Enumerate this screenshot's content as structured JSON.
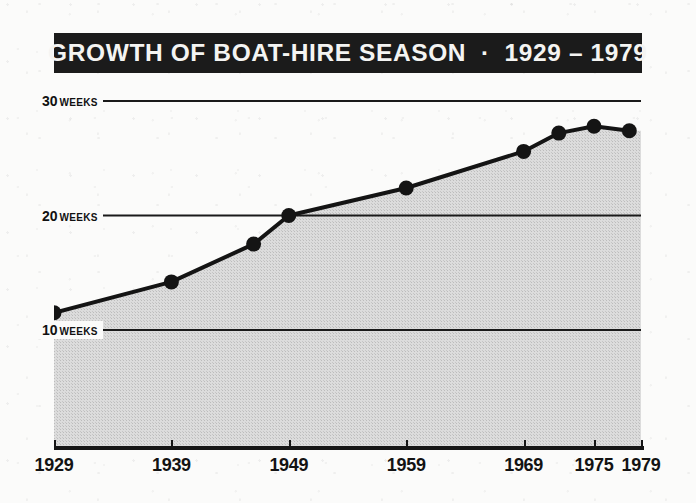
{
  "title": "GROWTH OF BOAT-HIRE SEASON  ·  1929 – 1979",
  "y_axis": {
    "unit_label": "WEEKS",
    "ticks": [
      {
        "value": "30",
        "unit": "WEEKS"
      },
      {
        "value": "20",
        "unit": "WEEKS"
      },
      {
        "value": "10",
        "unit": "WEEKS"
      }
    ]
  },
  "x_axis": {
    "labels": [
      "1929",
      "1939",
      "1949",
      "1959",
      "1969",
      "1975",
      "1979"
    ]
  },
  "colors": {
    "banner_background": "#1b1b1b",
    "banner_text": "#f4f4f2",
    "line": "#141414",
    "marker": "#141414",
    "area_fill": "#d6d6d6",
    "paper": "#fbfbfa",
    "axis": "#161616"
  },
  "chart_data": {
    "type": "line",
    "title": "GROWTH OF BOAT-HIRE SEASON  ·  1929 – 1979",
    "xlabel": "",
    "ylabel": "WEEKS",
    "xlim": [
      1929,
      1979
    ],
    "ylim": [
      0,
      32
    ],
    "grid": true,
    "gridlines_y": [
      10,
      20,
      30
    ],
    "legend": "none",
    "x_tick_labels": [
      "1929",
      "1939",
      "1949",
      "1959",
      "1969",
      "1975",
      "1979"
    ],
    "y_tick_labels": [
      "10 WEEKS",
      "20 WEEKS",
      "30 WEEKS"
    ],
    "series": [
      {
        "name": "Boat-hire season length",
        "unit": "weeks",
        "points": [
          {
            "x": 1929,
            "y": 11.5
          },
          {
            "x": 1939,
            "y": 14.2
          },
          {
            "x": 1946,
            "y": 17.5
          },
          {
            "x": 1949,
            "y": 20.0
          },
          {
            "x": 1959,
            "y": 22.4
          },
          {
            "x": 1969,
            "y": 25.6
          },
          {
            "x": 1972,
            "y": 27.2
          },
          {
            "x": 1975,
            "y": 27.8
          },
          {
            "x": 1978,
            "y": 27.4
          }
        ]
      }
    ]
  }
}
